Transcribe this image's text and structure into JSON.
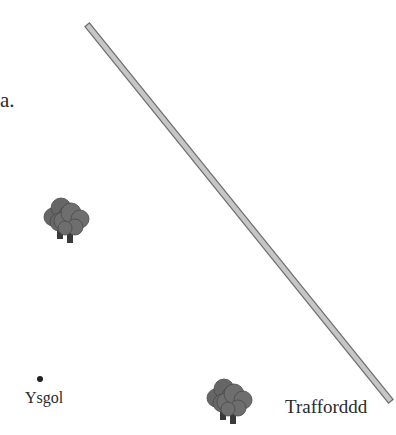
{
  "diagram": {
    "part_label": "a.",
    "colors": {
      "road_fill": "#c6c6c6",
      "road_outline": "#6e6e6e",
      "tree_foliage": "#6a6a6a",
      "tree_foliage_dark": "#555555",
      "tree_trunk": "#3a3a3a",
      "point": "#222222",
      "text": "#2a2a2a"
    },
    "features": [
      {
        "type": "road",
        "name": "road",
        "label": ""
      },
      {
        "type": "tree-cluster",
        "name": "trees-left",
        "label": ""
      },
      {
        "type": "tree-cluster",
        "name": "trees-bottom",
        "label": ""
      },
      {
        "type": "point",
        "name": "school",
        "label": "Ysgol"
      },
      {
        "type": "label",
        "name": "road-label",
        "label": "Trafford"
      }
    ],
    "school_label": "Ysgol",
    "road_label": "Trafforddd"
  }
}
